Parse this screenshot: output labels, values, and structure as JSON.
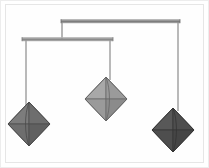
{
  "scene": {
    "title": "Hanging mobile sculpture with three octahedra",
    "width": 209,
    "height": 168,
    "background_color": "#ffffff",
    "frame_color": "#ededed",
    "inner_frame_color": "#e6e6e6"
  },
  "chart_data": {
    "type": "diagram",
    "title": "Kinetic mobile: two crossbars suspending three octahedral pendants",
    "bars": [
      {
        "name": "upper-crossbar",
        "x1": 61,
        "x2": 180,
        "y": 20,
        "thickness": 3,
        "color": "#7d7d7d",
        "top_color": "#a8a8a8"
      },
      {
        "name": "lower-crossbar",
        "x1": 22,
        "x2": 113,
        "y": 38,
        "thickness": 3,
        "color": "#8a8a8a",
        "top_color": "#b0b0b0"
      }
    ],
    "strings": [
      {
        "name": "connector-upper-to-lower",
        "x": 62,
        "y1": 21,
        "y2": 38,
        "color": "#8f8f8f"
      },
      {
        "name": "string-left-pendant",
        "x": 26,
        "y1": 39,
        "y2": 104,
        "color": "#949494"
      },
      {
        "name": "string-middle-pendant",
        "x": 110,
        "y1": 39,
        "y2": 79,
        "color": "#949494"
      },
      {
        "name": "string-right-pendant",
        "x": 178,
        "y1": 21,
        "y2": 110,
        "color": "#949494"
      }
    ],
    "pendants": [
      {
        "name": "left-octahedron",
        "cx": 29,
        "cy": 124,
        "half_width": 21,
        "half_height": 22,
        "fill": "#6e6e6e",
        "fill_light": "#7c7c7c",
        "fill_dark": "#606060",
        "edge": "#4a4a4a",
        "label": "medium gray octahedron"
      },
      {
        "name": "middle-octahedron",
        "cx": 106,
        "cy": 99,
        "half_width": 21,
        "half_height": 22,
        "fill": "#9a9a9a",
        "fill_light": "#a8a8a8",
        "fill_dark": "#8b8b8b",
        "edge": "#666666",
        "label": "light gray octahedron"
      },
      {
        "name": "right-octahedron",
        "cx": 173,
        "cy": 130,
        "half_width": 21,
        "half_height": 22,
        "fill": "#4e4e4e",
        "fill_light": "#585858",
        "fill_dark": "#454545",
        "edge": "#343434",
        "label": "dark gray octahedron"
      }
    ]
  }
}
